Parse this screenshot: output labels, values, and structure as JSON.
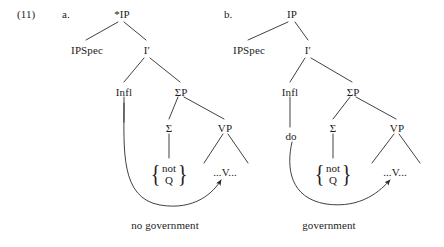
{
  "figure": {
    "example_number": "(11)",
    "type": "syntax-tree-pair"
  },
  "trees": [
    {
      "letter": "a.",
      "caption": "no government",
      "root": "*IP",
      "nodes": {
        "root": "*IP",
        "spec": "IPSpec",
        "ibar": "I′",
        "infl": "Infl",
        "sigmap": "ΣP",
        "sigma": "Σ",
        "vp": "VP",
        "v_label": "...V...",
        "infl_head": "",
        "set_items": [
          "not",
          "Q"
        ],
        "brace_left": "{",
        "brace_right": "}"
      }
    },
    {
      "letter": "b.",
      "caption": "government",
      "root": "IP",
      "nodes": {
        "root": "IP",
        "spec": "IPSpec",
        "ibar": "I′",
        "infl": "Infl",
        "sigmap": "ΣP",
        "sigma": "Σ",
        "vp": "VP",
        "v_label": "...V...",
        "infl_head": "do",
        "set_items": [
          "not",
          "Q"
        ],
        "brace_left": "{",
        "brace_right": "}"
      }
    }
  ],
  "style": {
    "line_color": "#2b2b2b",
    "text_color": "#1c1c1c",
    "background": "#ffffff"
  }
}
